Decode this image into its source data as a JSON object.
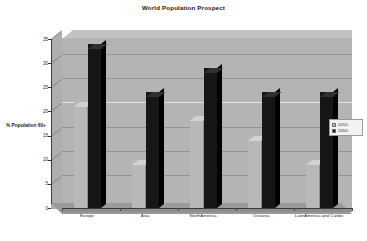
{
  "chart_data": {
    "type": "bar",
    "title": "World Population Prospect",
    "xlabel": "",
    "ylabel": "% Population 60+",
    "ylim": [
      0,
      35
    ],
    "yticks": [
      "0",
      "5",
      "10",
      "15",
      "20",
      "25",
      "30",
      "35"
    ],
    "grid": true,
    "legend_position": "right",
    "style": "3d-clustered-column",
    "categories": [
      "Europe",
      "Asia",
      "NorthAmerica",
      "Oceania",
      "LatinAmerica and Caribe"
    ],
    "series": [
      {
        "name": "2010",
        "color": "#b8b8b8",
        "values": [
          22,
          10,
          19,
          15,
          10
        ]
      },
      {
        "name": "2050",
        "color": "#161616",
        "values": [
          34,
          24,
          29,
          24,
          24
        ]
      }
    ]
  },
  "legend": {
    "items": [
      {
        "label": "2010",
        "swatch": "#b8b8b8"
      },
      {
        "label": "2050",
        "swatch": "#161616"
      }
    ]
  },
  "axis": {
    "y_title": "% Population 60+"
  }
}
